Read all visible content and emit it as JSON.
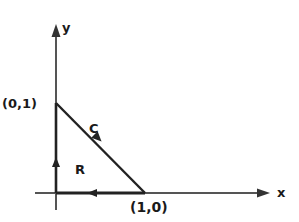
{
  "diagram": {
    "type": "line-integral-region",
    "axes": {
      "x_label": "x",
      "y_label": "y"
    },
    "points": {
      "apex_label": "(0,1)",
      "corner_label": "(1,0)"
    },
    "curve_label": "C",
    "region_label": "R",
    "colors": {
      "stroke": "#1a1a1a",
      "axis": "#555555",
      "background": "#ffffff"
    }
  }
}
